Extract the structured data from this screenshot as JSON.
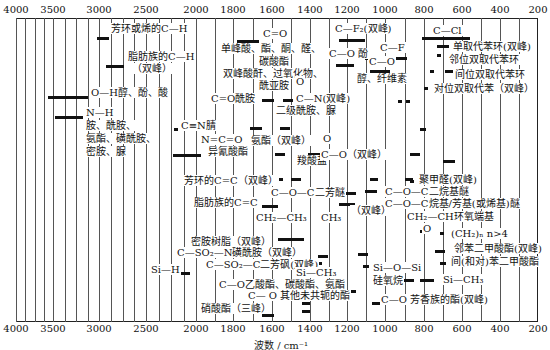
{
  "chart_data": {
    "type": "table",
    "xlabel": "波数/cm⁻¹",
    "ylabel": "",
    "x_ticks": [
      4000,
      3500,
      3000,
      2500,
      2000,
      1800,
      1600,
      1400,
      1200,
      1000,
      800,
      600,
      400,
      200
    ],
    "x_tick_px": [
      16,
      53,
      99,
      146,
      196,
      233,
      272,
      310,
      347,
      385,
      424,
      462,
      500,
      538
    ],
    "xlim": [
      4000,
      200
    ],
    "grid": true,
    "bands": [
      {
        "label": "芳环或烯的C—H",
        "range": [
          3100,
          3000
        ]
      },
      {
        "label": "脂肪族的C—H（双峰）",
        "range": [
          3000,
          2850
        ]
      },
      {
        "label": "O—H醇、酚、酸",
        "range": [
          3650,
          3000
        ]
      },
      {
        "label": "N—H 胺、酰胺、氨酯、磺酰胺、密胺、脲",
        "range": [
          3500,
          3100
        ]
      },
      {
        "label": "C≡N腈",
        "range": [
          2260,
          2240
        ]
      },
      {
        "label": "N=C=O 异氰酸酯",
        "range": [
          2300,
          2250
        ]
      },
      {
        "label": "C=O 单峰酸、酯、酮、醛、碳酸酯；双峰酸酐、过氧化物、酰亚胺",
        "range": [
          1800,
          1700
        ]
      },
      {
        "label": "C=O酰胺",
        "range": [
          1700,
          1630
        ]
      },
      {
        "label": "O=C—N（双峰）二级酰胺、脲",
        "range": [
          1570,
          1510
        ]
      },
      {
        "label": "氨酯（双峰）",
        "range": [
          1720,
          1530
        ]
      },
      {
        "label": "羧酸盐",
        "range": [
          1610,
          1400
        ]
      },
      {
        "label": "芳环的C=C（双峰）",
        "range": [
          1600,
          1500
        ]
      },
      {
        "label": "脂肪族的C=C",
        "range": [
          1680,
          1620
        ]
      },
      {
        "label": "CH2—CH3",
        "range": [
          1470,
          1450
        ]
      },
      {
        "label": "CH3",
        "range": [
          1380,
          1370
        ]
      },
      {
        "label": "C—F2（双峰）",
        "range": [
          1200,
          1100
        ]
      },
      {
        "label": "C—F",
        "range": [
          1100,
          900
        ]
      },
      {
        "label": "C—O 酚",
        "range": [
          1260,
          1180
        ]
      },
      {
        "label": "C—O 醇、纤维素",
        "range": [
          1100,
          1000
        ]
      },
      {
        "label": "O=C—O（双峰）",
        "range": [
          1300,
          1100
        ]
      },
      {
        "label": "C—O—C 二芳醚",
        "range": [
          1270,
          1230
        ]
      },
      {
        "label": "C—O—C 二烷基醚",
        "range": [
          1150,
          1060
        ]
      },
      {
        "label": "C—O—C 烷基/芳基（或烯基）醚",
        "range": [
          1270,
          1020
        ]
      },
      {
        "label": "聚甲醛（双峰）",
        "range": [
          935,
          900
        ]
      },
      {
        "label": "CH2—CH 环氧端基",
        "range": [
          915,
          830
        ]
      },
      {
        "label": "(CH2)n n>4",
        "range": [
          725,
          720
        ]
      },
      {
        "label": "C—Cl",
        "range": [
          800,
          600
        ]
      },
      {
        "label": "单取代苯环（双峰）",
        "range": [
          770,
          690
        ]
      },
      {
        "label": "邻位双取代苯环",
        "range": [
          770,
          735
        ]
      },
      {
        "label": "间位双取代苯环",
        "range": [
          810,
          690
        ]
      },
      {
        "label": "对位双取代苯",
        "range": [
          860,
          800
        ]
      },
      {
        "label": "蜜胺树脂（双峰）",
        "range": [
          1550,
          1350
        ]
      },
      {
        "label": "C—SO2—N 磺酰胺（双峰）",
        "range": [
          1370,
          1150
        ]
      },
      {
        "label": "C—SO2—C 二芳砜（双峰）",
        "range": [
          1330,
          1150
        ]
      },
      {
        "label": "Si—H",
        "range": [
          2250,
          2100
        ]
      },
      {
        "label": "Si—CH3",
        "range": [
          1260,
          800
        ]
      },
      {
        "label": "Si—O—Si 硅氧烷",
        "range": [
          1100,
          1000
        ]
      },
      {
        "label": "C—O 乙酸酯、碳酸酯、氨酯",
        "range": [
          1250,
          1240
        ]
      },
      {
        "label": "C—O 其他未共轭的酯",
        "range": [
          1200,
          1150
        ]
      },
      {
        "label": "C—O 芳香族的酯（双峰）",
        "range": [
          1300,
          1100
        ]
      },
      {
        "label": "邻苯二甲酸酯（双峰）",
        "range": [
          1290,
          1070
        ]
      },
      {
        "label": "间（和对）苯二甲酸酯",
        "range": [
          1270,
          730
        ]
      },
      {
        "label": "硝酸酯（三峰）",
        "range": [
          1650,
          1270
        ]
      }
    ]
  },
  "axis": {
    "top_ticks": [
      "4000",
      "3500",
      "3000",
      "2500",
      "2000",
      "1800",
      "1600",
      "1400",
      "1200",
      "1000",
      "800",
      "600",
      "400",
      "200"
    ],
    "bottom_ticks": [
      "4000",
      "3500",
      "3000",
      "2500",
      "2000",
      "1800",
      "1600",
      "1400",
      "1200",
      "1000",
      "800",
      "600",
      "400",
      "200"
    ],
    "xlabel": "波数 / cm⁻¹"
  },
  "labels": [
    {
      "text": "芳环或烯的C—H",
      "x": 110,
      "y": 29
    },
    {
      "text": "脂肪族的C—H",
      "x": 127,
      "y": 57
    },
    {
      "text": "（双峰）",
      "x": 131,
      "y": 69
    },
    {
      "text": "O—H醇、酚、酸",
      "x": 90,
      "y": 93
    },
    {
      "text": "N—H",
      "x": 85,
      "y": 113
    },
    {
      "text": "胺、酰胺、",
      "x": 85,
      "y": 126
    },
    {
      "text": "氨酯、磺酰胺、",
      "x": 85,
      "y": 139
    },
    {
      "text": "密胺、脲",
      "x": 85,
      "y": 152
    },
    {
      "text": "C=O",
      "x": 262,
      "y": 34
    },
    {
      "text": "单峰酸、酯、酮、醛、",
      "x": 220,
      "y": 49
    },
    {
      "text": "碳酸酯",
      "x": 258,
      "y": 62
    },
    {
      "text": "双峰酸酐、过氧化物、",
      "x": 222,
      "y": 74
    },
    {
      "text": "酰亚胺",
      "x": 258,
      "y": 86
    },
    {
      "text": "C=O酰胺",
      "x": 210,
      "y": 99
    },
    {
      "text": "O",
      "x": 295,
      "y": 82
    },
    {
      "text": "C—N(双峰)",
      "x": 295,
      "y": 99
    },
    {
      "text": "二级酰胺、脲",
      "x": 275,
      "y": 111
    },
    {
      "text": "C≡N腈",
      "x": 180,
      "y": 126
    },
    {
      "text": "氨酯（双峰）",
      "x": 250,
      "y": 141
    },
    {
      "text": "N=C=O",
      "x": 200,
      "y": 140
    },
    {
      "text": "异氰酸酯",
      "x": 207,
      "y": 152
    },
    {
      "text": "羧酸盐",
      "x": 296,
      "y": 161
    },
    {
      "text": "O",
      "x": 322,
      "y": 139
    },
    {
      "text": "C—O（双峰）",
      "x": 320,
      "y": 155
    },
    {
      "text": "芳环的C=C（双峰）",
      "x": 183,
      "y": 181
    },
    {
      "text": "脂肪族的C=C",
      "x": 193,
      "y": 203
    },
    {
      "text": "C—O—C二芳醚",
      "x": 270,
      "y": 193
    },
    {
      "text": "（双峰）",
      "x": 350,
      "y": 211
    },
    {
      "text": "CH₂—CH₃",
      "x": 255,
      "y": 218
    },
    {
      "text": "CH₃",
      "x": 320,
      "y": 218
    },
    {
      "text": "C—F₂(双峰)",
      "x": 334,
      "y": 29
    },
    {
      "text": "C—F",
      "x": 379,
      "y": 48
    },
    {
      "text": "C—O 酚",
      "x": 328,
      "y": 54
    },
    {
      "text": "C—O",
      "x": 368,
      "y": 62
    },
    {
      "text": "醇、纤维素",
      "x": 356,
      "y": 79
    },
    {
      "text": "C—Cl",
      "x": 432,
      "y": 31
    },
    {
      "text": "单取代苯环(双峰)",
      "x": 452,
      "y": 47
    },
    {
      "text": "邻位双取代苯环",
      "x": 448,
      "y": 60
    },
    {
      "text": "间位双取代苯环",
      "x": 454,
      "y": 75
    },
    {
      "text": "对位双取代苯（双峰）",
      "x": 433,
      "y": 89
    },
    {
      "text": "聚甲醛(双峰)",
      "x": 418,
      "y": 180
    },
    {
      "text": "C—O—C二烷基醚",
      "x": 384,
      "y": 192
    },
    {
      "text": "C—O—C烷基/芳基(或烯基)醚",
      "x": 384,
      "y": 204
    },
    {
      "text": "CH₂—CH环氧端基",
      "x": 406,
      "y": 217
    },
    {
      "text": "O",
      "x": 422,
      "y": 229
    },
    {
      "text": "(CH₂)ₙ n>4",
      "x": 450,
      "y": 234
    },
    {
      "text": "邻苯二甲酸酯(双峰)",
      "x": 453,
      "y": 249
    },
    {
      "text": "间(和对)苯二甲酸酯",
      "x": 450,
      "y": 262
    },
    {
      "text": "Si—CH₃",
      "x": 442,
      "y": 280
    },
    {
      "text": "密胺树脂（双峰）",
      "x": 190,
      "y": 242
    },
    {
      "text": "C—SO₂—N磺酰胺（双峰）",
      "x": 176,
      "y": 253
    },
    {
      "text": "C—SO₂—C二芳砜(双峰)",
      "x": 205,
      "y": 265
    },
    {
      "text": "Si—H",
      "x": 150,
      "y": 270
    },
    {
      "text": "Si—CH₃",
      "x": 295,
      "y": 273
    },
    {
      "text": "C—O乙酸酯、碳酸酯、氨酯",
      "x": 218,
      "y": 285
    },
    {
      "text": "C— O  其他未共轭的酯",
      "x": 247,
      "y": 296
    },
    {
      "text": "硝酸酯（三峰）",
      "x": 200,
      "y": 309
    },
    {
      "text": "Si—O—Si",
      "x": 372,
      "y": 268
    },
    {
      "text": "硅氧烷",
      "x": 372,
      "y": 281
    },
    {
      "text": "C—O 芳香族的酯(双峰)",
      "x": 380,
      "y": 300
    }
  ],
  "bars": [
    {
      "x": 97,
      "y": 37,
      "w": 12
    },
    {
      "x": 106,
      "y": 65,
      "w": 18
    },
    {
      "x": 48,
      "y": 96,
      "w": 40
    },
    {
      "x": 55,
      "y": 116,
      "w": 28
    },
    {
      "x": 174,
      "y": 128,
      "w": 4
    },
    {
      "x": 173,
      "y": 154,
      "w": 28
    },
    {
      "x": 237,
      "y": 40,
      "w": 22
    },
    {
      "x": 262,
      "y": 99,
      "w": 12
    },
    {
      "x": 283,
      "y": 99,
      "w": 10
    },
    {
      "x": 250,
      "y": 127,
      "w": 12
    },
    {
      "x": 280,
      "y": 127,
      "w": 10
    },
    {
      "x": 275,
      "y": 153,
      "w": 10
    },
    {
      "x": 308,
      "y": 153,
      "w": 10
    },
    {
      "x": 273,
      "y": 178,
      "w": 10
    },
    {
      "x": 291,
      "y": 178,
      "w": 10
    },
    {
      "x": 262,
      "y": 205,
      "w": 16
    },
    {
      "x": 308,
      "y": 157,
      "w": 8
    },
    {
      "x": 339,
      "y": 39,
      "w": 26
    },
    {
      "x": 365,
      "y": 57,
      "w": 42
    },
    {
      "x": 336,
      "y": 64,
      "w": 18
    },
    {
      "x": 370,
      "y": 70,
      "w": 20
    },
    {
      "x": 318,
      "y": 153,
      "w": 10
    },
    {
      "x": 346,
      "y": 153,
      "w": 8
    },
    {
      "x": 410,
      "y": 153,
      "w": 10
    },
    {
      "x": 370,
      "y": 178,
      "w": 8
    },
    {
      "x": 405,
      "y": 178,
      "w": 8
    },
    {
      "x": 346,
      "y": 192,
      "w": 10
    },
    {
      "x": 365,
      "y": 190,
      "w": 12
    },
    {
      "x": 339,
      "y": 203,
      "w": 16
    },
    {
      "x": 376,
      "y": 205,
      "w": 10
    },
    {
      "x": 422,
      "y": 37,
      "w": 48
    },
    {
      "x": 437,
      "y": 45,
      "w": 12
    },
    {
      "x": 437,
      "y": 54,
      "w": 4
    },
    {
      "x": 430,
      "y": 70,
      "w": 4
    },
    {
      "x": 445,
      "y": 70,
      "w": 8
    },
    {
      "x": 424,
      "y": 87,
      "w": 4
    },
    {
      "x": 398,
      "y": 100,
      "w": 4
    },
    {
      "x": 406,
      "y": 100,
      "w": 4
    },
    {
      "x": 420,
      "y": 128,
      "w": 6
    },
    {
      "x": 443,
      "y": 160,
      "w": 12
    },
    {
      "x": 410,
      "y": 180,
      "w": 4
    },
    {
      "x": 420,
      "y": 230,
      "w": 6
    },
    {
      "x": 440,
      "y": 232,
      "w": 4
    },
    {
      "x": 435,
      "y": 250,
      "w": 10
    },
    {
      "x": 440,
      "y": 262,
      "w": 6
    },
    {
      "x": 278,
      "y": 238,
      "w": 26
    },
    {
      "x": 318,
      "y": 255,
      "w": 10
    },
    {
      "x": 316,
      "y": 262,
      "w": 6
    },
    {
      "x": 358,
      "y": 253,
      "w": 10
    },
    {
      "x": 363,
      "y": 265,
      "w": 6
    },
    {
      "x": 286,
      "y": 265,
      "w": 10
    },
    {
      "x": 178,
      "y": 272,
      "w": 12
    },
    {
      "x": 302,
      "y": 283,
      "w": 6
    },
    {
      "x": 346,
      "y": 290,
      "w": 10
    },
    {
      "x": 302,
      "y": 302,
      "w": 8
    },
    {
      "x": 302,
      "y": 310,
      "w": 8
    },
    {
      "x": 262,
      "y": 314,
      "w": 12
    },
    {
      "x": 372,
      "y": 279,
      "w": 42
    },
    {
      "x": 420,
      "y": 279,
      "w": 14
    },
    {
      "x": 372,
      "y": 302,
      "w": 8
    },
    {
      "x": 418,
      "y": 302,
      "w": 8
    }
  ]
}
